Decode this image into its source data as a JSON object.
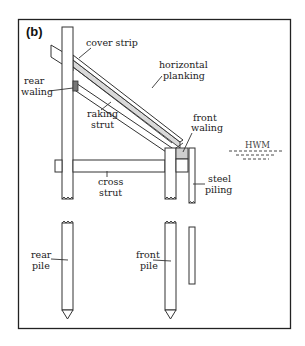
{
  "figure": {
    "panel_label": "(b)",
    "labels": {
      "cover_strip": "cover strip",
      "horizontal_planking_1": "horizontal",
      "horizontal_planking_2": "planking",
      "rear_waling_1": "rear",
      "rear_waling_2": "waling",
      "raking_strut_1": "raking",
      "raking_strut_2": "strut",
      "front_waling_1": "front",
      "front_waling_2": "waling",
      "hwm": "HWM",
      "cross_strut_1": "cross",
      "cross_strut_2": "strut",
      "steel_piling_1": "steel",
      "steel_piling_2": "piling",
      "rear_pile_1": "rear",
      "rear_pile_2": "pile",
      "front_pile_1": "front",
      "front_pile_2": "pile"
    },
    "colors": {
      "line": "#333333",
      "waling_fill": "#cfcfcf",
      "planking_fill": "#d9d9d9",
      "rear_waling_fill": "#777777"
    }
  }
}
